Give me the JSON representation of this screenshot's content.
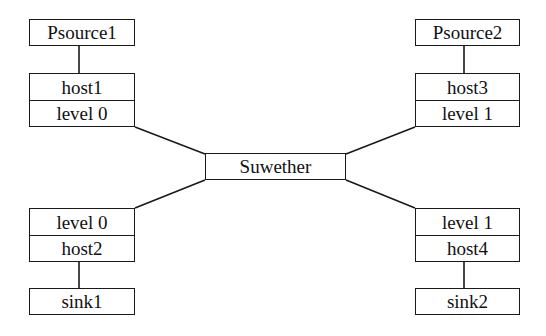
{
  "diagram": {
    "hub": {
      "label": "Suwether"
    },
    "top_left": {
      "source": "Psource1",
      "stack": [
        "host1",
        "level 0"
      ]
    },
    "top_right": {
      "source": "Psource2",
      "stack": [
        "host3",
        "level 1"
      ]
    },
    "bottom_left": {
      "stack": [
        "level 0",
        "host2"
      ],
      "sink": "sink1"
    },
    "bottom_right": {
      "stack": [
        "level 1",
        "host4"
      ],
      "sink": "sink2"
    },
    "colors": {
      "stroke": "#1a1a1a",
      "background": "#ffffff"
    }
  }
}
